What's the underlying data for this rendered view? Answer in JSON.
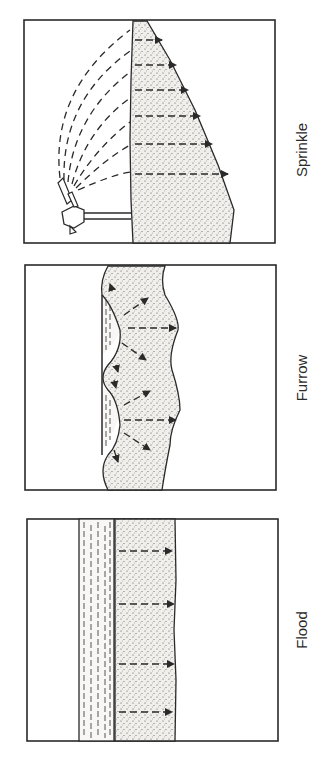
{
  "figure": {
    "panels": [
      {
        "id": "sprinkle",
        "label": "Sprinkle",
        "description": "Sprinkler head on a pipe spraying arcs of water onto soil surface; dashed arrows show downward infiltration forming a triangular wetted profile"
      },
      {
        "id": "furrow",
        "label": "Furrow",
        "description": "Water in furrows between ridges; arrows show lateral and downward infiltration into soil"
      },
      {
        "id": "flood",
        "label": "Flood",
        "description": "Ponded water layer over the soil surface; parallel dashed arrows show uniform downward infiltration"
      }
    ],
    "orientation": "rotated 90 degrees counter-clockwise",
    "colors": {
      "line": "#2a2a2a",
      "soil_fill": "#ece9e4",
      "background": "#ffffff"
    }
  }
}
